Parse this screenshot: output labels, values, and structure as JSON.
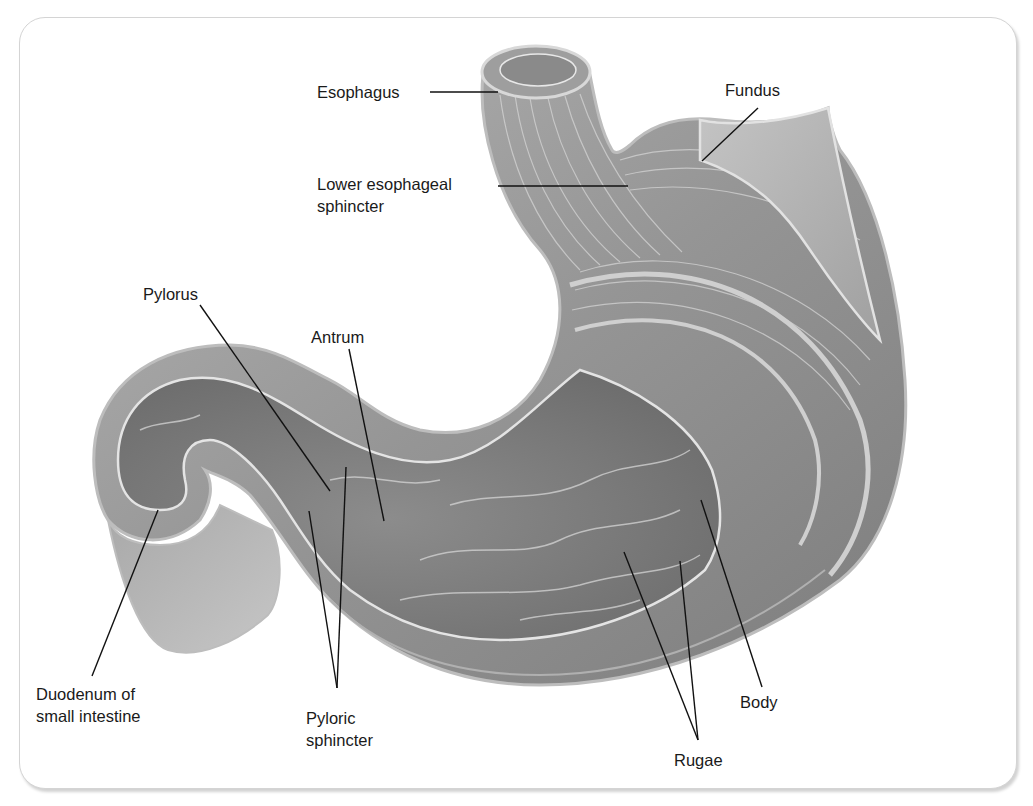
{
  "figure": {
    "frame_border_color": "#d4d4d4",
    "tissue_colors": {
      "outer_muscle": "#9a9a9a",
      "inner_lumen": "#7f7f7f",
      "highlight": "#e6e6e6",
      "serosa_edge": "#c2c2c2"
    },
    "labels": [
      {
        "id": "esophagus",
        "lines": [
          "Esophagus"
        ],
        "x": 317,
        "y": 81
      },
      {
        "id": "fundus",
        "lines": [
          "Fundus"
        ],
        "x": 725,
        "y": 79
      },
      {
        "id": "lower-esophageal-sphincter",
        "lines": [
          "Lower esophageal",
          "sphincter"
        ],
        "x": 317,
        "y": 173
      },
      {
        "id": "pylorus",
        "lines": [
          "Pylorus"
        ],
        "x": 143,
        "y": 283
      },
      {
        "id": "antrum",
        "lines": [
          "Antrum"
        ],
        "x": 311,
        "y": 326
      },
      {
        "id": "duodenum",
        "lines": [
          "Duodenum of",
          "small intestine"
        ],
        "x": 36,
        "y": 683
      },
      {
        "id": "pyloric-sphincter",
        "lines": [
          "Pyloric",
          "sphincter"
        ],
        "x": 306,
        "y": 707
      },
      {
        "id": "body",
        "lines": [
          "Body"
        ],
        "x": 740,
        "y": 691
      },
      {
        "id": "rugae",
        "lines": [
          "Rugae"
        ],
        "x": 674,
        "y": 749
      }
    ],
    "leader_lines": [
      {
        "label": "esophagus",
        "points": [
          [
            430,
            92
          ],
          [
            498,
            92
          ]
        ]
      },
      {
        "label": "fundus",
        "points": [
          [
            758,
            108
          ],
          [
            702,
            161
          ]
        ]
      },
      {
        "label": "lower-esophageal-sphincter",
        "points": [
          [
            498,
            186
          ],
          [
            628,
            186
          ]
        ]
      },
      {
        "label": "pylorus",
        "points": [
          [
            200,
            305
          ],
          [
            330,
            491
          ]
        ]
      },
      {
        "label": "antrum",
        "points": [
          [
            349,
            349
          ],
          [
            384,
            521
          ]
        ]
      },
      {
        "label": "duodenum",
        "points": [
          [
            158,
            510
          ],
          [
            92,
            676
          ]
        ]
      },
      {
        "label": "pyloric-sphincter-a",
        "points": [
          [
            309,
            511
          ],
          [
            337,
            688
          ]
        ]
      },
      {
        "label": "pyloric-sphincter-b",
        "points": [
          [
            346,
            467
          ],
          [
            337,
            688
          ]
        ]
      },
      {
        "label": "body",
        "points": [
          [
            701,
            500
          ],
          [
            762,
            687
          ]
        ]
      },
      {
        "label": "rugae-a",
        "points": [
          [
            624,
            552
          ],
          [
            698,
            740
          ]
        ]
      },
      {
        "label": "rugae-b",
        "points": [
          [
            680,
            561
          ],
          [
            698,
            740
          ]
        ]
      }
    ]
  }
}
